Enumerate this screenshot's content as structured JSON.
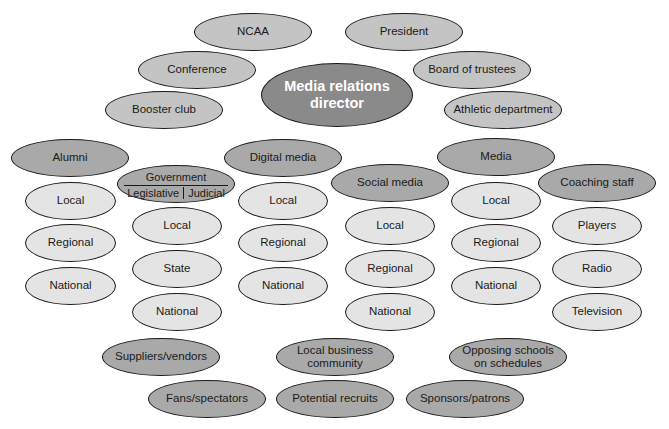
{
  "diagram": {
    "center": {
      "label": "Media relations director"
    },
    "top_ring": [
      {
        "id": "ncaa",
        "label": "NCAA"
      },
      {
        "id": "president",
        "label": "President"
      },
      {
        "id": "conference",
        "label": "Conference"
      },
      {
        "id": "board",
        "label": "Board of trustees"
      },
      {
        "id": "booster",
        "label": "Booster club"
      },
      {
        "id": "athletic",
        "label": "Athletic department"
      }
    ],
    "groups": [
      {
        "id": "alumni",
        "label": "Alumni",
        "children": [
          "Local",
          "Regional",
          "National"
        ]
      },
      {
        "id": "government",
        "label": "Government",
        "branches": [
          "Legislative",
          "Judicial"
        ],
        "children": [
          "Local",
          "State",
          "National"
        ]
      },
      {
        "id": "digital_media",
        "label": "Digital media",
        "children": [
          "Local",
          "Regional",
          "National"
        ]
      },
      {
        "id": "social_media",
        "label": "Social media",
        "children": [
          "Local",
          "Regional",
          "National"
        ]
      },
      {
        "id": "media",
        "label": "Media",
        "children": [
          "Local",
          "Regional",
          "National"
        ]
      },
      {
        "id": "coaching_staff",
        "label": "Coaching staff",
        "children": [
          "Players",
          "Radio",
          "Television"
        ]
      }
    ],
    "bottom_ring": [
      {
        "id": "suppliers",
        "label": "Suppliers/vendors"
      },
      {
        "id": "local_business",
        "label": "Local business community"
      },
      {
        "id": "opposing",
        "label": "Opposing schools on schedules"
      },
      {
        "id": "fans",
        "label": "Fans/spectators"
      },
      {
        "id": "recruits",
        "label": "Potential recruits"
      },
      {
        "id": "sponsors",
        "label": "Sponsors/patrons"
      }
    ]
  },
  "colors": {
    "center_fill": "#8a8a8a",
    "group_fill": "#a9a9a9",
    "ring_fill": "#c4c4c4",
    "leaf_fill": "#e4e4e4",
    "outline": "#1a1a1a"
  }
}
